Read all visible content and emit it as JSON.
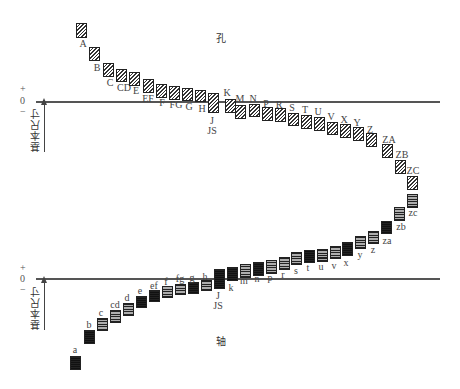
{
  "hole": {
    "title": "孔",
    "zero_y": 102,
    "sign_plus": "+",
    "sign_zero": "0",
    "sign_minus": "−",
    "basic_size_label": "基本尺寸",
    "items": [
      {
        "label": "A",
        "x": 76,
        "y": 23,
        "h": 15,
        "lx": 83,
        "ly": 39
      },
      {
        "label": "B",
        "x": 89,
        "y": 47,
        "h": 14,
        "lx": 97,
        "ly": 63
      },
      {
        "label": "C",
        "x": 103,
        "y": 63,
        "h": 14,
        "lx": 110,
        "ly": 78
      },
      {
        "label": "CD",
        "x": 116,
        "y": 69,
        "h": 13,
        "lx": 124,
        "ly": 83
      },
      {
        "label": "E",
        "x": 129,
        "y": 72,
        "h": 14,
        "lx": 136,
        "ly": 86
      },
      {
        "label": "EF",
        "x": 143,
        "y": 79,
        "h": 14,
        "lx": 148,
        "ly": 94
      },
      {
        "label": "F",
        "x": 156,
        "y": 84,
        "h": 14,
        "lx": 162,
        "ly": 98
      },
      {
        "label": "FG",
        "x": 169,
        "y": 86,
        "h": 14,
        "lx": 176,
        "ly": 100
      },
      {
        "label": "G",
        "x": 182,
        "y": 88,
        "h": 13,
        "lx": 189,
        "ly": 102
      },
      {
        "label": "H",
        "x": 195,
        "y": 90,
        "h": 12,
        "lx": 202,
        "ly": 104
      },
      {
        "label": "J\nJS",
        "x": 208,
        "y": 93,
        "h": 20,
        "lx": 212,
        "ly": 116
      },
      {
        "label": "K",
        "x": 225,
        "y": 99,
        "h": 14,
        "lx": 227,
        "ly": 88
      },
      {
        "label": "M",
        "x": 235,
        "y": 105,
        "h": 14,
        "lx": 240,
        "ly": 94
      },
      {
        "label": "N",
        "x": 249,
        "y": 104,
        "h": 13,
        "lx": 253,
        "ly": 94
      },
      {
        "label": "P",
        "x": 262,
        "y": 107,
        "h": 14,
        "lx": 266,
        "ly": 99
      },
      {
        "label": "R",
        "x": 275,
        "y": 108,
        "h": 14,
        "lx": 279,
        "ly": 100
      },
      {
        "label": "S",
        "x": 288,
        "y": 113,
        "h": 13,
        "lx": 292,
        "ly": 103
      },
      {
        "label": "T",
        "x": 301,
        "y": 115,
        "h": 14,
        "lx": 305,
        "ly": 105
      },
      {
        "label": "U",
        "x": 314,
        "y": 117,
        "h": 14,
        "lx": 318,
        "ly": 107
      },
      {
        "label": "V",
        "x": 327,
        "y": 122,
        "h": 13,
        "lx": 331,
        "ly": 112
      },
      {
        "label": "X",
        "x": 340,
        "y": 124,
        "h": 14,
        "lx": 344,
        "ly": 115
      },
      {
        "label": "Y",
        "x": 353,
        "y": 127,
        "h": 14,
        "lx": 357,
        "ly": 118
      },
      {
        "label": "Z",
        "x": 366,
        "y": 133,
        "h": 14,
        "lx": 370,
        "ly": 125
      },
      {
        "label": "ZA",
        "x": 382,
        "y": 144,
        "h": 14,
        "lx": 389,
        "ly": 135
      },
      {
        "label": "ZB",
        "x": 395,
        "y": 160,
        "h": 14,
        "lx": 402,
        "ly": 150
      },
      {
        "label": "ZC",
        "x": 407,
        "y": 176,
        "h": 14,
        "lx": 413,
        "ly": 166
      }
    ]
  },
  "shaft": {
    "title": "轴",
    "zero_y": 279,
    "sign_plus": "+",
    "sign_zero": "0",
    "sign_minus": "−",
    "basic_size_label": "基本尺寸",
    "items": [
      {
        "label": "a",
        "x": 70,
        "y": 356,
        "h": 14,
        "lx": 75,
        "ly": 345,
        "dark": true
      },
      {
        "label": "b",
        "x": 84,
        "y": 330,
        "h": 14,
        "lx": 89,
        "ly": 320,
        "dark": true
      },
      {
        "label": "c",
        "x": 97,
        "y": 318,
        "h": 13,
        "lx": 101,
        "ly": 308,
        "dark": false
      },
      {
        "label": "cd",
        "x": 110,
        "y": 310,
        "h": 13,
        "lx": 115,
        "ly": 300,
        "dark": false
      },
      {
        "label": "d",
        "x": 123,
        "y": 303,
        "h": 13,
        "lx": 127,
        "ly": 293,
        "dark": false
      },
      {
        "label": "e",
        "x": 136,
        "y": 296,
        "h": 12,
        "lx": 140,
        "ly": 286,
        "dark": true
      },
      {
        "label": "ef",
        "x": 149,
        "y": 290,
        "h": 12,
        "lx": 154,
        "ly": 281,
        "dark": true
      },
      {
        "label": "f",
        "x": 162,
        "y": 286,
        "h": 12,
        "lx": 166,
        "ly": 277,
        "dark": false
      },
      {
        "label": "fg",
        "x": 175,
        "y": 284,
        "h": 11,
        "lx": 180,
        "ly": 274,
        "dark": false
      },
      {
        "label": "g",
        "x": 188,
        "y": 282,
        "h": 12,
        "lx": 192,
        "ly": 273,
        "dark": true
      },
      {
        "label": "h",
        "x": 201,
        "y": 280,
        "h": 11,
        "lx": 205,
        "ly": 272,
        "dark": false
      },
      {
        "label": "J\nJS",
        "x": 214,
        "y": 269,
        "h": 20,
        "lx": 218,
        "ly": 291,
        "dark": true
      },
      {
        "label": "k",
        "x": 227,
        "y": 267,
        "h": 14,
        "lx": 231,
        "ly": 283,
        "dark": true
      },
      {
        "label": "m",
        "x": 240,
        "y": 264,
        "h": 14,
        "lx": 244,
        "ly": 276,
        "dark": false
      },
      {
        "label": "n",
        "x": 253,
        "y": 262,
        "h": 14,
        "lx": 257,
        "ly": 274,
        "dark": true
      },
      {
        "label": "p",
        "x": 266,
        "y": 260,
        "h": 14,
        "lx": 270,
        "ly": 273,
        "dark": false
      },
      {
        "label": "r",
        "x": 279,
        "y": 257,
        "h": 13,
        "lx": 283,
        "ly": 270,
        "dark": false
      },
      {
        "label": "s",
        "x": 291,
        "y": 252,
        "h": 13,
        "lx": 296,
        "ly": 266,
        "dark": false
      },
      {
        "label": "t",
        "x": 304,
        "y": 250,
        "h": 13,
        "lx": 308,
        "ly": 263,
        "dark": true
      },
      {
        "label": "u",
        "x": 317,
        "y": 249,
        "h": 13,
        "lx": 321,
        "ly": 262,
        "dark": false
      },
      {
        "label": "v",
        "x": 330,
        "y": 246,
        "h": 13,
        "lx": 334,
        "ly": 261,
        "dark": false
      },
      {
        "label": "x",
        "x": 342,
        "y": 242,
        "h": 14,
        "lx": 346,
        "ly": 258,
        "dark": true
      },
      {
        "label": "y",
        "x": 355,
        "y": 236,
        "h": 13,
        "lx": 360,
        "ly": 250,
        "dark": false
      },
      {
        "label": "z",
        "x": 368,
        "y": 231,
        "h": 13,
        "lx": 373,
        "ly": 245,
        "dark": false
      },
      {
        "label": "za",
        "x": 381,
        "y": 221,
        "h": 13,
        "lx": 387,
        "ly": 236,
        "dark": true
      },
      {
        "label": "zb",
        "x": 394,
        "y": 207,
        "h": 14,
        "lx": 401,
        "ly": 222,
        "dark": false
      },
      {
        "label": "zc",
        "x": 407,
        "y": 194,
        "h": 14,
        "lx": 413,
        "ly": 208,
        "dark": false
      }
    ]
  }
}
